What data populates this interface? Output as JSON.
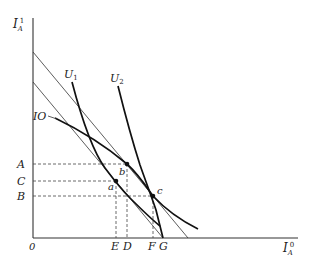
{
  "diagram": {
    "axes": {
      "y_label": "I",
      "y_label_sub": "A",
      "y_label_sup": "1",
      "x_label": "I",
      "x_label_sub": "A",
      "x_label_sup": "0",
      "origin_label": "0"
    },
    "y_ticks": [
      "A",
      "C",
      "B"
    ],
    "x_ticks": [
      "E",
      "D",
      "F",
      "G"
    ],
    "curves": [
      {
        "label": "U",
        "sub": "1"
      },
      {
        "label": "U",
        "sub": "2"
      },
      {
        "label": "IO"
      }
    ],
    "points": [
      "a",
      "b",
      "c"
    ]
  }
}
